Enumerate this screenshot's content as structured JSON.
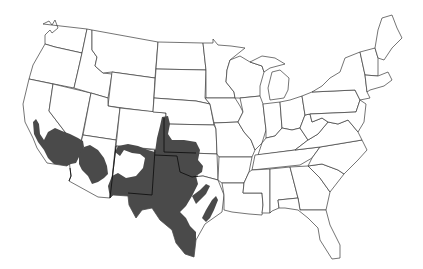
{
  "map": {
    "subject": "Contiguous United States outline map with shaded species range",
    "background_color": "#ffffff",
    "outline_color": "#3a3a3a",
    "range_color": "#4a4a4a",
    "shaded_regions": [
      "Southern California",
      "Southern Nevada tip",
      "Arizona",
      "New Mexico",
      "Southeastern Colorado",
      "Southwestern Kansas",
      "Western Oklahoma",
      "Texas"
    ]
  }
}
